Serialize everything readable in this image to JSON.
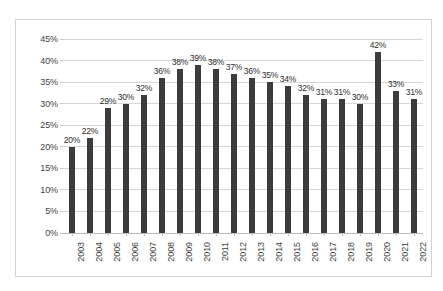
{
  "chart_data": {
    "type": "bar",
    "title": "",
    "subtitle": "",
    "xlabel": "",
    "ylabel": "",
    "categories": [
      "2003",
      "2004",
      "2005",
      "2006",
      "2007",
      "2008",
      "2009",
      "2010",
      "2011",
      "2012",
      "2013",
      "2014",
      "2015",
      "2016",
      "2017",
      "2018",
      "2019",
      "2020",
      "2021",
      "2022"
    ],
    "values": [
      20,
      22,
      29,
      30,
      32,
      36,
      38,
      39,
      38,
      37,
      36,
      35,
      34,
      32,
      31,
      31,
      30,
      42,
      33,
      31
    ],
    "data_labels": [
      "20%",
      "22%",
      "29%",
      "30%",
      "32%",
      "36%",
      "38%",
      "39%",
      "38%",
      "37%",
      "36%",
      "35%",
      "34%",
      "32%",
      "31%",
      "31%",
      "30%",
      "42%",
      "33%",
      "31%"
    ],
    "ylim": [
      0,
      45
    ],
    "ytick_values": [
      0,
      5,
      10,
      15,
      20,
      25,
      30,
      35,
      40,
      45
    ],
    "ytick_labels": [
      "0%",
      "5%",
      "10%",
      "15%",
      "20%",
      "25%",
      "30%",
      "35%",
      "40%",
      "45%"
    ],
    "grid": true,
    "legend": false,
    "legend_position": "none",
    "bar_color": "#3c3c3c",
    "gridline_color": "#d6d6d6",
    "axis_text_color": "#3f3f3f",
    "plot_background": "#ffffff",
    "frame_border_color": "#d2d2d2"
  }
}
